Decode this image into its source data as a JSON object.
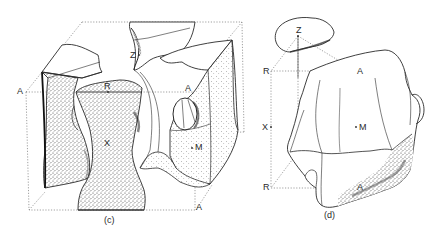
{
  "figure": {
    "panels": [
      {
        "id": "c",
        "caption": "(c)",
        "labels": {
          "A_left": "A",
          "R": "R",
          "Z": "Z",
          "A_upper_right": "A",
          "X": "X",
          "M": "M",
          "A_bottom_right": "A"
        }
      },
      {
        "id": "d",
        "caption": "(d)",
        "labels": {
          "Z": "Z",
          "R_top": "R",
          "A_top": "A",
          "X": "X",
          "M": "M",
          "R_bottom": "R",
          "A_bottom": "A"
        }
      }
    ],
    "colors": {
      "ink": "#2a2a2a",
      "shade": "#555555",
      "dotted": "#777777",
      "background": "#ffffff"
    }
  }
}
